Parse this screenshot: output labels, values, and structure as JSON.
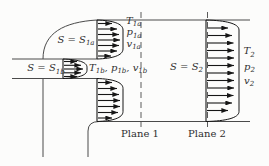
{
  "colors": {
    "wall": "#4a4a4a",
    "arrow": "#161616",
    "text": "#2e2e2e",
    "dash": "#5a5a5a",
    "background": "#fcfcfb"
  },
  "labels": {
    "s1a": {
      "base": "S = S",
      "sub": "1a"
    },
    "s1b": {
      "base": "S = S",
      "sub": "1b"
    },
    "t1a": {
      "base": "T",
      "sub": "1a"
    },
    "p1a": {
      "base": "p",
      "sub": "1a"
    },
    "v1a": {
      "base": "v",
      "sub": "1a"
    },
    "row1b": {
      "p1": "T",
      "s1": "1b",
      "p2": ", p",
      "s2": "1b",
      "p3": ", v",
      "s3": "1b"
    },
    "s2": {
      "base": "S = S",
      "sub": "2"
    },
    "t2": {
      "base": "T",
      "sub": "2"
    },
    "p2": {
      "base": "p",
      "sub": "2"
    },
    "v2": {
      "base": "v",
      "sub": "2"
    },
    "plane1": "Plane 1",
    "plane2": "Plane 2"
  },
  "profiles": [
    {
      "id": "upper-inlet",
      "x": 97,
      "yTop": 20,
      "yBottom": 59,
      "bulge": 123,
      "arrowYs": [
        23.5,
        29,
        34.5,
        40,
        45.5,
        51,
        56
      ],
      "tips": [
        112,
        117,
        119,
        120,
        119,
        117,
        111
      ]
    },
    {
      "id": "side-inlet",
      "x": 63,
      "yTop": 59,
      "yBottom": 78.5,
      "bulge": 87,
      "arrowYs": [
        61.5,
        65.3,
        69,
        72.8,
        76.5
      ],
      "tips": [
        77,
        81,
        83,
        81,
        77
      ]
    },
    {
      "id": "lower-inlet",
      "x": 97,
      "yTop": 78.5,
      "yBottom": 121.5,
      "bulge": 123,
      "arrowYs": [
        82.5,
        88.5,
        94.5,
        100.5,
        106.5,
        112.5,
        118
      ],
      "tips": [
        112,
        117,
        119,
        120,
        120,
        118,
        112
      ]
    },
    {
      "id": "outlet",
      "x": 206,
      "yTop": 20,
      "yBottom": 121.5,
      "bulge": 239,
      "arrowYs": [
        28,
        35.5,
        43,
        50.5,
        58,
        65.5,
        73,
        80.5,
        88,
        95.5,
        103,
        110.5
      ],
      "tips": [
        228,
        232,
        233.5,
        234,
        234,
        234,
        234,
        234,
        234,
        233.5,
        232,
        228
      ]
    }
  ]
}
